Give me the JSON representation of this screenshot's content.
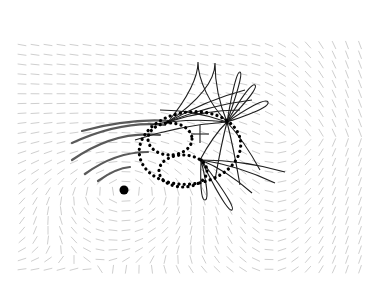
{
  "figure": {
    "width": 391,
    "height": 283,
    "background": "#ffffff",
    "colors": {
      "field_dash": "#cfcfcf",
      "arc": "#5a5a5a",
      "petal": "#1e1e1e",
      "dotted": "#000000",
      "marker": "#000000"
    },
    "field": {
      "region": [
        22,
        45,
        372,
        270
      ],
      "vortex_center": [
        125,
        190
      ],
      "spacing": 13,
      "dash_length": 8
    },
    "vortex_dot": {
      "cx": 124,
      "cy": 190,
      "r": 4.5
    },
    "plus_marker": {
      "cx": 200,
      "cy": 134,
      "size": 9
    },
    "hubs": [
      {
        "name": "hub-upper-left",
        "cx": 168,
        "cy": 122
      },
      {
        "name": "hub-right",
        "cx": 227,
        "cy": 122
      },
      {
        "name": "hub-lower",
        "cx": 201,
        "cy": 160
      }
    ],
    "dotted_curves": [
      {
        "name": "large-ellipse",
        "cx": 190,
        "cy": 148,
        "rx": 51,
        "ry": 36,
        "rot": -8
      },
      {
        "name": "small-ellipse-upper",
        "cx": 170,
        "cy": 139,
        "rx": 22,
        "ry": 16,
        "rot": 0
      },
      {
        "name": "small-ellipse-lower",
        "cx": 183,
        "cy": 171,
        "rx": 24,
        "ry": 16,
        "rot": 0
      }
    ],
    "arcs": [
      {
        "from": [
          82,
          131
        ],
        "ctrl": [
          130,
          118
        ],
        "to": [
          170,
          121
        ]
      },
      {
        "from": [
          72,
          143
        ],
        "ctrl": [
          122,
          120
        ],
        "to": [
          165,
          125
        ]
      },
      {
        "from": [
          72,
          160
        ],
        "ctrl": [
          115,
          130
        ],
        "to": [
          160,
          135
        ]
      },
      {
        "from": [
          85,
          174
        ],
        "ctrl": [
          115,
          152
        ],
        "to": [
          148,
          152
        ]
      },
      {
        "from": [
          98,
          181
        ],
        "ctrl": [
          116,
          168
        ],
        "to": [
          130,
          167
        ]
      }
    ]
  }
}
